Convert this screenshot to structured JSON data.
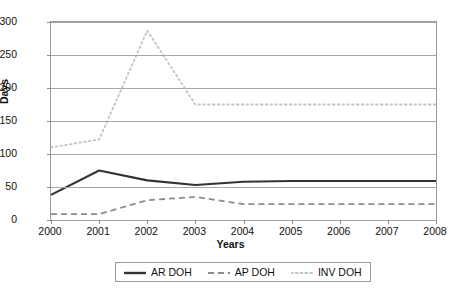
{
  "chart_data": {
    "type": "line",
    "title": "",
    "xlabel": "Years",
    "ylabel": "Days",
    "categories": [
      "2000",
      "2001",
      "2002",
      "2003",
      "2004",
      "2005",
      "2006",
      "2007",
      "2008"
    ],
    "x": [
      2000,
      2001,
      2002,
      2003,
      2004,
      2005,
      2006,
      2007,
      2008
    ],
    "xlim": [
      2000,
      2008
    ],
    "ylim": [
      0,
      300
    ],
    "yticks": [
      0,
      50,
      100,
      150,
      200,
      250,
      300
    ],
    "ytick_labels": [
      "0",
      "50",
      "100",
      "150",
      "200",
      "250",
      "300"
    ],
    "grid": "horizontal",
    "legend_position": "bottom",
    "series": [
      {
        "name": "AR DOH",
        "style": "solid",
        "color": "#333333",
        "values": [
          38,
          75,
          60,
          53,
          58,
          59,
          59,
          59,
          59
        ]
      },
      {
        "name": "AP DOH",
        "style": "dashed",
        "color": "#8c8c8c",
        "values": [
          9,
          9,
          30,
          35,
          24,
          24,
          24,
          24,
          24
        ]
      },
      {
        "name": "INV DOH",
        "style": "dotted",
        "color": "#c2c2c2",
        "values": [
          110,
          122,
          287,
          175,
          175,
          175,
          175,
          175,
          175
        ]
      }
    ]
  },
  "colors": {
    "axis": "#9a9a9a",
    "grid": "#a8a8a8",
    "text": "#111111",
    "background": "#ffffff"
  }
}
